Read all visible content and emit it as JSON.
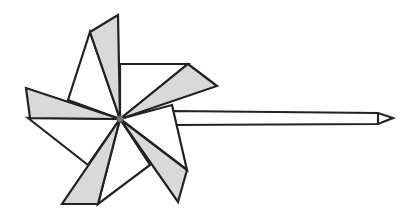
{
  "figure": {
    "colors": {
      "stroke": "#222222",
      "shade": "#d9d9d9",
      "white": "#ffffff",
      "center": "#777777"
    }
  }
}
